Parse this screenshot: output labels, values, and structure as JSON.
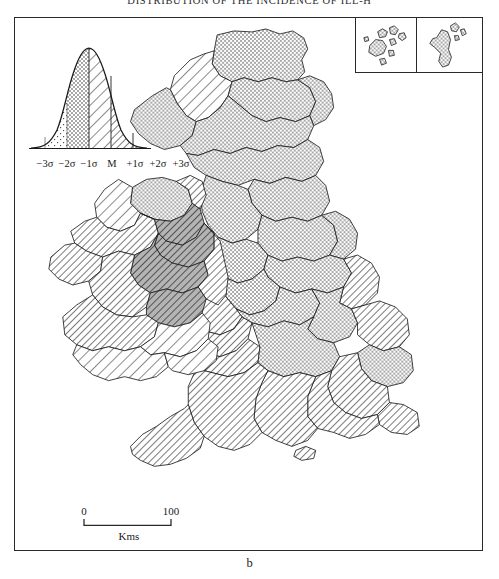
{
  "page": {
    "running_head": "DISTRIBUTION OF THE INCIDENCE OF ILL-H",
    "figure_caption": "b"
  },
  "legend": {
    "type": "normal-distribution-curve",
    "mean_label": "M",
    "axis_labels": [
      "−3σ",
      "−2σ",
      "−1σ",
      "M",
      "+1σ",
      "+2σ",
      "+3σ"
    ],
    "classes": [
      {
        "range": "below −2σ",
        "pattern": "blank",
        "description": "unshaded"
      },
      {
        "range": "−2σ to −1σ",
        "pattern": "sparse-dots",
        "description": "light stipple"
      },
      {
        "range": "−1σ to M",
        "pattern": "dense-dots",
        "description": "medium stipple"
      },
      {
        "range": "M to +1σ",
        "pattern": "sparse-hatch",
        "description": "light diagonal hatch"
      },
      {
        "range": "+1σ to +2σ",
        "pattern": "dense-hatch",
        "description": "dense diagonal hatch"
      },
      {
        "range": "+2σ to +3σ",
        "pattern": "solid-hatch",
        "description": "heavy diagonal hatch"
      }
    ]
  },
  "scale": {
    "start_label": "0",
    "end_label": "100",
    "unit_label": "Kms"
  },
  "insets": [
    {
      "name": "orkney-islands",
      "pattern": "dense-dots"
    },
    {
      "name": "shetland-islands",
      "pattern": "dense-dots"
    }
  ],
  "map": {
    "title": "British Isles county choropleth",
    "regions": [
      {
        "name": "scotland-highlands-north",
        "pattern": "dense-dots"
      },
      {
        "name": "scotland-highlands-west",
        "pattern": "sparse-hatch"
      },
      {
        "name": "scotland-grampian",
        "pattern": "dense-dots"
      },
      {
        "name": "scotland-central",
        "pattern": "dense-dots"
      },
      {
        "name": "scotland-borders",
        "pattern": "dense-dots"
      },
      {
        "name": "england-north",
        "pattern": "dense-dots"
      },
      {
        "name": "england-midlands",
        "pattern": "dense-dots"
      },
      {
        "name": "england-east",
        "pattern": "dense-hatch"
      },
      {
        "name": "england-southwest",
        "pattern": "dense-hatch"
      },
      {
        "name": "wales",
        "pattern": "dense-hatch"
      },
      {
        "name": "ireland-west",
        "pattern": "dense-hatch"
      },
      {
        "name": "ireland-midlands",
        "pattern": "dense-hatch-grey"
      },
      {
        "name": "ireland-south",
        "pattern": "sparse-hatch"
      },
      {
        "name": "northern-ireland",
        "pattern": "dense-dots"
      }
    ]
  }
}
